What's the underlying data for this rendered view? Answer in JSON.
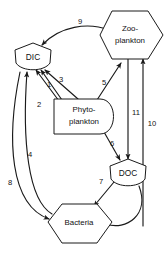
{
  "diagram": {
    "background_color": "#ffffff",
    "line_color": "#1a1a1a",
    "text_color": "#111111",
    "nodes": [
      {
        "id": "dic",
        "label": "DIC",
        "shape": "shield-pentagon",
        "cx": 33,
        "cy": 58
      },
      {
        "id": "zooplankton",
        "label_line1": "Zoo-",
        "label_line2": "plankton",
        "shape": "hexagon",
        "cx": 130,
        "cy": 35
      },
      {
        "id": "phytoplankton",
        "label_line1": "Phyto-",
        "label_line2": "plankton",
        "shape": "d-rounded-rect",
        "cx": 83,
        "cy": 116
      },
      {
        "id": "doc",
        "label": "DOC",
        "shape": "shield-pentagon",
        "cx": 128,
        "cy": 174
      },
      {
        "id": "bacteria",
        "label": "Bacteria",
        "shape": "hexagon",
        "cx": 77,
        "cy": 222
      }
    ],
    "edges": [
      {
        "id": "e1",
        "number": "1",
        "from": "phytoplankton",
        "to": "dic",
        "label_x": 49,
        "label_y": 85
      },
      {
        "id": "e2",
        "number": "2",
        "from": "phytoplankton",
        "to": "dic",
        "label_x": 39,
        "label_y": 105
      },
      {
        "id": "e3",
        "number": "3",
        "from": "phytoplankton",
        "to": "dic",
        "label_x": 61,
        "label_y": 80
      },
      {
        "id": "e4",
        "number": "4",
        "from": "bacteria",
        "to": "dic",
        "label_x": 30,
        "label_y": 155
      },
      {
        "id": "e5",
        "number": "5",
        "from": "phytoplankton",
        "to": "zooplankton",
        "label_x": 104,
        "label_y": 83
      },
      {
        "id": "e6",
        "number": "6",
        "from": "phytoplankton",
        "to": "doc",
        "label_x": 112,
        "label_y": 144
      },
      {
        "id": "e7",
        "number": "7",
        "from": "doc",
        "to": "bacteria",
        "label_x": 101,
        "label_y": 182
      },
      {
        "id": "e8",
        "number": "8",
        "from": "bacteria",
        "to": "dic",
        "label_x": 10,
        "label_y": 183
      },
      {
        "id": "e9",
        "number": "9",
        "from": "zooplankton",
        "to": "dic",
        "label_x": 80,
        "label_y": 22
      },
      {
        "id": "e10",
        "number": "10",
        "from": "bacteria",
        "to": "zooplankton",
        "label_x": 152,
        "label_y": 124
      },
      {
        "id": "e11",
        "number": "11",
        "from": "zooplankton",
        "to": "doc",
        "label_x": 136,
        "label_y": 113
      }
    ]
  }
}
